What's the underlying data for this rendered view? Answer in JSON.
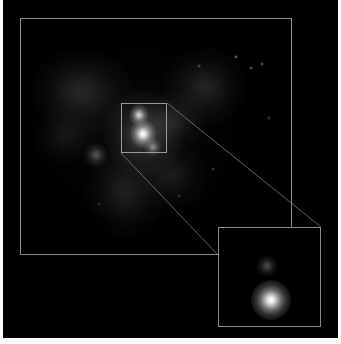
{
  "figure": {
    "type": "astronomical-image",
    "title": "",
    "caption": "",
    "background_color": "#000000",
    "page_background": "#ffffff",
    "frame_color": "#8a8a8a",
    "roi_box_color": "#9a9a9a",
    "leader_line_color": "#8a8a8a"
  },
  "main_frame": {
    "label": "main-field-frame",
    "x": 17,
    "y": 18,
    "width": 272,
    "height": 237
  },
  "roi_box": {
    "label": "zoom-region-box",
    "x": 118,
    "y": 103,
    "width": 46,
    "height": 50
  },
  "inset": {
    "label": "magnified-inset",
    "x": 215,
    "y": 227,
    "width": 103,
    "height": 100,
    "sources": [
      {
        "name": "inset-primary-core",
        "cx": 52,
        "cy": 72,
        "radius": 20,
        "peak": 1.0
      },
      {
        "name": "inset-secondary-knot",
        "cx": 48,
        "cy": 38,
        "radius": 11,
        "peak": 0.28
      }
    ]
  },
  "leader_lines": [
    {
      "name": "leader-line-upper",
      "x1": 164,
      "y1": 103,
      "x2": 318,
      "y2": 227
    },
    {
      "name": "leader-line-lower",
      "x1": 118,
      "y1": 153,
      "x2": 215,
      "y2": 255
    }
  ],
  "sky_sources": [
    {
      "name": "core-knot-bright",
      "cx": 140,
      "cy": 134,
      "rx": 13,
      "ry": 14,
      "peak": 1.0
    },
    {
      "name": "core-knot-upper",
      "cx": 136,
      "cy": 115,
      "rx": 10,
      "ry": 11,
      "peak": 0.78
    },
    {
      "name": "core-knot-lower",
      "cx": 150,
      "cy": 147,
      "rx": 9,
      "ry": 9,
      "peak": 0.45
    },
    {
      "name": "knot-southwest",
      "cx": 93,
      "cy": 155,
      "rx": 12,
      "ry": 12,
      "peak": 0.3
    },
    {
      "name": "diffuse-halo-core",
      "cx": 141,
      "cy": 133,
      "rx": 40,
      "ry": 42,
      "peak": 0.22
    },
    {
      "name": "diffuse-northwest",
      "cx": 78,
      "cy": 92,
      "rx": 52,
      "ry": 44,
      "peak": 0.14
    },
    {
      "name": "diffuse-northeast",
      "cx": 202,
      "cy": 87,
      "rx": 42,
      "ry": 40,
      "peak": 0.13
    },
    {
      "name": "diffuse-south",
      "cx": 122,
      "cy": 192,
      "rx": 40,
      "ry": 46,
      "peak": 0.11
    },
    {
      "name": "diffuse-southeast",
      "cx": 168,
      "cy": 176,
      "rx": 36,
      "ry": 34,
      "peak": 0.09
    },
    {
      "name": "diffuse-west-tail",
      "cx": 62,
      "cy": 136,
      "rx": 34,
      "ry": 30,
      "peak": 0.08
    },
    {
      "name": "diffuse-bridge",
      "cx": 170,
      "cy": 120,
      "rx": 34,
      "ry": 30,
      "peak": 0.1
    },
    {
      "name": "outer-envelope",
      "cx": 138,
      "cy": 135,
      "rx": 96,
      "ry": 88,
      "peak": 0.05
    }
  ],
  "field_stars": [
    {
      "name": "field-star-1",
      "cx": 233,
      "cy": 57,
      "size": 2,
      "peak": 0.55
    },
    {
      "name": "field-star-2",
      "cx": 248,
      "cy": 68,
      "size": 2,
      "peak": 0.45
    },
    {
      "name": "field-star-3",
      "cx": 259,
      "cy": 64,
      "size": 2,
      "peak": 0.4
    },
    {
      "name": "field-star-4",
      "cx": 196,
      "cy": 66,
      "size": 2,
      "peak": 0.35
    },
    {
      "name": "field-star-5",
      "cx": 210,
      "cy": 169,
      "size": 2,
      "peak": 0.3
    },
    {
      "name": "field-star-6",
      "cx": 266,
      "cy": 118,
      "size": 2,
      "peak": 0.28
    },
    {
      "name": "field-star-7",
      "cx": 176,
      "cy": 196,
      "size": 2,
      "peak": 0.25
    },
    {
      "name": "field-star-8",
      "cx": 96,
      "cy": 204,
      "size": 2,
      "peak": 0.22
    }
  ]
}
